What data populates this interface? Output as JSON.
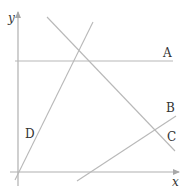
{
  "diagram": {
    "type": "coordinate-lines",
    "axes": {
      "x_label": "x",
      "y_label": "y",
      "color": "#b0b0b0"
    },
    "lines": [
      {
        "id": "A",
        "label": "A",
        "description": "horizontal line parallel to x-axis",
        "color": "#b8b8b8"
      },
      {
        "id": "B",
        "label": "B",
        "description": "line with positive slope, crosses x-axis right of origin",
        "color": "#b8b8b8"
      },
      {
        "id": "C",
        "label": "C",
        "description": "line with negative slope",
        "color": "#b8b8b8"
      },
      {
        "id": "D",
        "label": "D",
        "description": "steep line with positive slope through origin",
        "color": "#b8b8b8"
      }
    ]
  }
}
